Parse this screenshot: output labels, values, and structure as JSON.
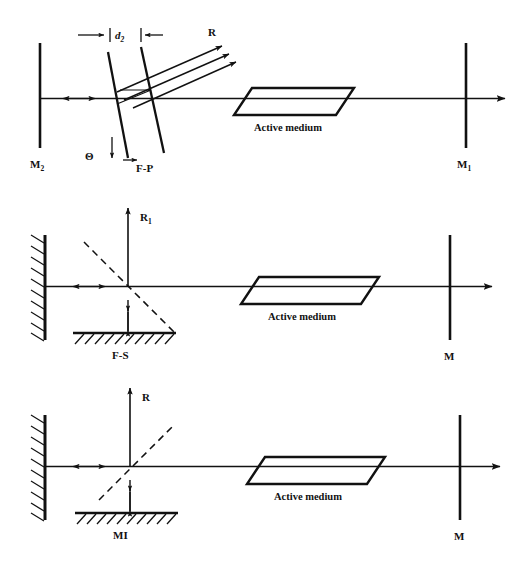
{
  "figure": {
    "background_color": "#ffffff",
    "ink_color": "#111111",
    "width": 520,
    "height": 572,
    "panel_count": 3
  },
  "panels": [
    {
      "id": "panel-fabry-perot",
      "name": "Fabry-Perot etalon resonator",
      "labels": {
        "left_mirror": "M",
        "left_mirror_subscript": "2",
        "right_mirror": "M",
        "right_mirror_subscript": "1",
        "gain_medium": "Active medium",
        "etalon": "F-P",
        "spacing": "d",
        "spacing_subscript": "2",
        "tilt_angle": "Θ",
        "output_ray": "R"
      },
      "elements": [
        "left-mirror-bar",
        "right-mirror-bar",
        "optical-axis",
        "axis-double-arrow",
        "etalon-plate-front",
        "etalon-plate-back",
        "reflected-ray-1",
        "reflected-ray-2",
        "reflected-ray-3",
        "dimension-line",
        "angle-indicator",
        "active-medium-parallelogram"
      ]
    },
    {
      "id": "panel-fox-smith",
      "name": "Fox-Smith mode selector resonator",
      "labels": {
        "left_mirror": "",
        "right_mirror": "M",
        "gain_medium": "Active medium",
        "selector": "F-S",
        "output_ray": "R",
        "output_ray_subscript": "1"
      },
      "elements": [
        "left-hatched-mirror",
        "right-mirror-bar",
        "optical-axis",
        "axis-double-arrow",
        "beamsplitter-dashed",
        "vertical-ray-axis",
        "gap-double-arrow",
        "hatched-surface",
        "active-medium-parallelogram"
      ]
    },
    {
      "id": "panel-michelson",
      "name": "Michelson interferometer mode selector resonator",
      "labels": {
        "left_mirror": "",
        "right_mirror": "M",
        "gain_medium": "Active medium",
        "selector": "MI",
        "output_ray": "R"
      },
      "elements": [
        "left-hatched-mirror",
        "right-mirror-bar",
        "optical-axis",
        "axis-double-arrow",
        "beamsplitter-dashed",
        "vertical-ray-axis",
        "gap-double-arrow",
        "hatched-surface",
        "active-medium-parallelogram"
      ]
    }
  ]
}
